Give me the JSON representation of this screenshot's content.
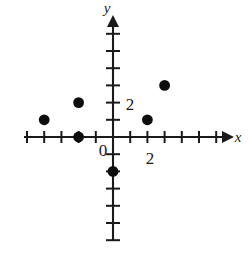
{
  "chart_data": {
    "type": "scatter",
    "title": "",
    "xlabel": "x",
    "ylabel": "y",
    "grid": false,
    "legend": null,
    "xlim": [
      -5.2,
      6.5
    ],
    "ylim": [
      -6.9,
      6.9
    ],
    "x_tick_labels": [
      {
        "value": 2,
        "text": "2"
      }
    ],
    "y_tick_labels": [
      {
        "value": 2,
        "text": "2"
      }
    ],
    "origin_label": "0",
    "x_ticks": [
      -5,
      -4,
      -3,
      -2,
      -1,
      1,
      2,
      3,
      4,
      5,
      6
    ],
    "y_ticks": [
      -6,
      -5,
      -4,
      -3,
      -2,
      -1,
      1,
      2,
      3,
      4,
      5,
      6
    ],
    "points": [
      {
        "x": -4,
        "y": 1
      },
      {
        "x": -2,
        "y": 2
      },
      {
        "x": -2,
        "y": 0
      },
      {
        "x": 0,
        "y": -2
      },
      {
        "x": 2,
        "y": 1
      },
      {
        "x": 3,
        "y": 3
      }
    ],
    "point_color": "#0d0d0d",
    "axis_color": "#1a1a1a",
    "point_radius": 5.4
  },
  "labels": {
    "y_axis_name": "y",
    "x_axis_name": "x",
    "origin": "0",
    "x_two": "2",
    "y_two": "2"
  }
}
